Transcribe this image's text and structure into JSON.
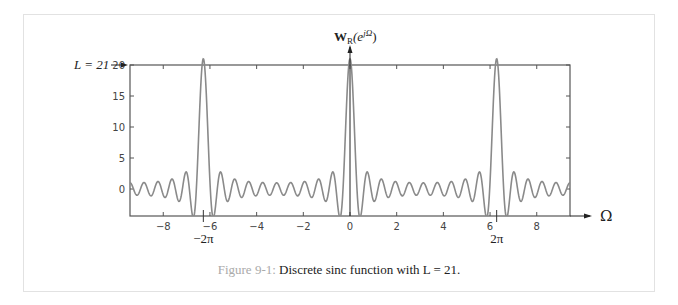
{
  "figure": {
    "caption_label": "Figure 9-1:",
    "caption_text": " Discrete sinc function with L = 21.",
    "y_axis_title": "W",
    "y_axis_title_sub": "R",
    "y_axis_title_arg": "(e",
    "y_axis_title_sup": "jΩ",
    "y_axis_title_close": ")",
    "x_axis_title": "Ω",
    "annotation_L": "L = 21",
    "annotation_neg2pi": "−2π",
    "annotation_2pi": "2π"
  },
  "chart_data": {
    "type": "line",
    "title": "Discrete sinc function with L = 21",
    "function": "sin(L*Omega/2)/sin(Omega/2)",
    "L": 21,
    "xlabel": "Ω",
    "ylabel": "W_R(e^{jΩ})",
    "xlim": [
      -9.4248,
      9.4248
    ],
    "ylim": [
      -4.4,
      20.6
    ],
    "xticks": [
      -8,
      -6,
      -4,
      -2,
      0,
      2,
      4,
      6,
      8
    ],
    "xtick_labels": [
      "−8",
      "−6",
      "−4",
      "−2",
      "0",
      "2",
      "4",
      "6",
      "8"
    ],
    "yticks": [
      0,
      5,
      10,
      15,
      20
    ],
    "ytick_labels": [
      "0",
      "5",
      "10",
      "15",
      "20"
    ],
    "peaks": [
      {
        "x": -6.2832,
        "y": 21
      },
      {
        "x": 0,
        "y": 21
      },
      {
        "x": 6.2832,
        "y": 21
      }
    ],
    "annotations": [
      "L = 21 (peak height)",
      "−2π",
      "2π"
    ],
    "grid": false,
    "line_color": "#8a8a8a"
  }
}
